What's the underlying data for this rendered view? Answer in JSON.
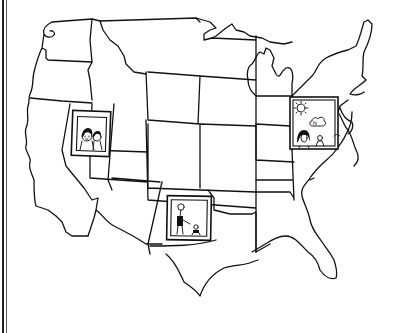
{
  "image": {
    "description": "Hand-drawn black line sketch of the contiguous United States map with three framed pictures placed on the map",
    "style": "black ink on white",
    "colors": {
      "background": "#ffffff",
      "ink": "#111111"
    }
  },
  "border": {
    "side": "left",
    "type": "double vertical rule"
  },
  "frames": [
    {
      "id": "west",
      "location": "Nevada area",
      "content": "two people (faces) looking out"
    },
    {
      "id": "east",
      "location": "Ohio / Pennsylvania area",
      "content": "sun, speech cloud, a woman and a small child",
      "speech_text": "hi"
    },
    {
      "id": "south",
      "location": "New Mexico / Texas panhandle area",
      "content": "standing person with a small child or dog"
    }
  ]
}
